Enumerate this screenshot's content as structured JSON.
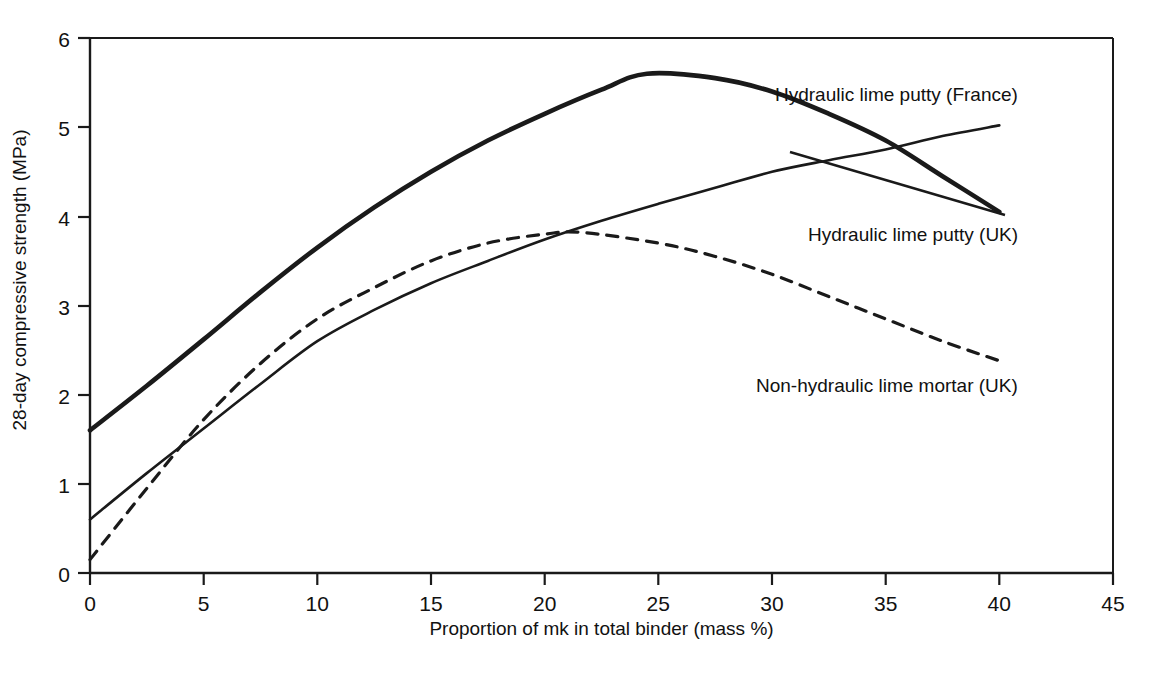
{
  "chart_data": {
    "type": "line",
    "title": "",
    "xlabel": "Proportion of mk in total binder (mass %)",
    "ylabel": "28-day compressive strength (MPa)",
    "xlim": [
      0,
      45
    ],
    "ylim": [
      0,
      6
    ],
    "xticks": [
      "0",
      "5",
      "10",
      "15",
      "20",
      "25",
      "30",
      "35",
      "40",
      "45"
    ],
    "yticks": [
      "0",
      "1",
      "2",
      "3",
      "4",
      "5",
      "6"
    ],
    "grid": false,
    "legend_position": "inline-annotations",
    "series": [
      {
        "name": "Hydraulic lime putty (France)",
        "style": "solid-bold",
        "x": [
          0,
          2.5,
          5,
          7.5,
          10,
          12.5,
          15,
          17.5,
          20,
          22.5,
          24.5,
          27.5,
          30,
          32.5,
          35,
          37.5,
          40
        ],
        "values": [
          1.6,
          2.1,
          2.62,
          3.15,
          3.65,
          4.1,
          4.5,
          4.85,
          5.15,
          5.42,
          5.6,
          5.55,
          5.4,
          5.15,
          4.85,
          4.45,
          4.05
        ]
      },
      {
        "name": "Hydraulic lime putty (UK)",
        "style": "solid-thin",
        "x": [
          0,
          2.5,
          5,
          7.5,
          10,
          12.5,
          15,
          17.5,
          20,
          22.5,
          25,
          27.5,
          30,
          32.5,
          35,
          37.5,
          40
        ],
        "values": [
          0.6,
          1.12,
          1.62,
          2.12,
          2.6,
          2.95,
          3.25,
          3.5,
          3.74,
          3.95,
          4.14,
          4.32,
          4.5,
          4.63,
          4.75,
          4.9,
          5.02
        ]
      },
      {
        "name": "Non-hydraulic lime mortar (UK)",
        "style": "dashed",
        "x": [
          0,
          2.5,
          5,
          7.5,
          10,
          12.5,
          15,
          17.5,
          20,
          21.6,
          25,
          27.5,
          30,
          32.5,
          35,
          37.5,
          40
        ],
        "values": [
          0.15,
          0.95,
          1.72,
          2.35,
          2.85,
          3.2,
          3.5,
          3.7,
          3.8,
          3.82,
          3.7,
          3.55,
          3.35,
          3.1,
          2.85,
          2.6,
          2.38
        ]
      }
    ],
    "annotations": [
      {
        "text": "Hydraulic lime putty (France)",
        "x_px": 1018,
        "y_px": 96
      },
      {
        "text": "Hydraulic lime putty (UK)",
        "x_px": 1018,
        "y_px": 236
      },
      {
        "text": "Non-hydraulic lime mortar (UK)",
        "x_px": 1018,
        "y_px": 387
      }
    ],
    "notable_points": {
      "france_peak": {
        "x": 24.5,
        "y": 5.6
      },
      "nonhydraulic_peak": {
        "x": 21.6,
        "y": 3.82
      },
      "solid_curves_crossing": {
        "x": 34.7,
        "y": 4.7
      }
    },
    "colors": {
      "line": "#1a1a1a",
      "axis": "#1a1a1a",
      "background": "#ffffff"
    }
  }
}
